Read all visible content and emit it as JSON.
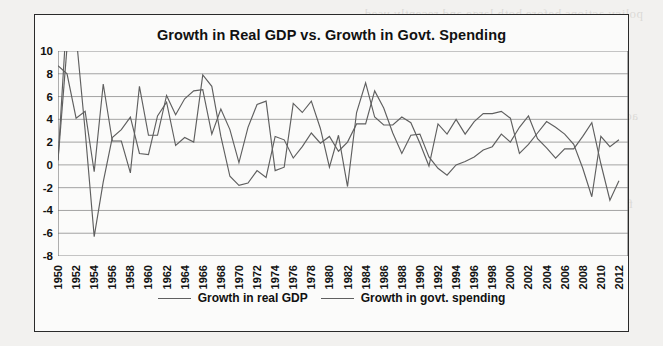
{
  "figure": {
    "title": "Growth in Real GDP vs. Growth in Govt. Spending",
    "frame_color": "#2a2a2a",
    "plot_bg": "#fbfbfa"
  },
  "legend": {
    "position": "bottom-center",
    "items": [
      {
        "label": "Growth in real GDP",
        "color": "#5f5f5f"
      },
      {
        "label": "Growth in govt. spending",
        "color": "#5f5f5f"
      }
    ]
  },
  "axes": {
    "y_ticks": [
      "10",
      "8",
      "6",
      "4",
      "2",
      "0",
      "-2",
      "-4",
      "-6",
      "-8"
    ],
    "x_ticks": [
      "1950",
      "1952",
      "1954",
      "1956",
      "1958",
      "1960",
      "1962",
      "1964",
      "1966",
      "1968",
      "1970",
      "1972",
      "1974",
      "1976",
      "1978",
      "1980",
      "1982",
      "1984",
      "1986",
      "1988",
      "1990",
      "1992",
      "1994",
      "1996",
      "1998",
      "2000",
      "2002",
      "2004",
      "2006",
      "2008",
      "2010",
      "2012"
    ]
  },
  "bleed_text": [
    "policy actions before both large and recently used",
    "the effects of fiscal policy action must be copied at the high level of the right amount and",
    "the right direction",
    "pies fiscal policy in the same way as a monetary policy action is the",
    "box",
    "actions",
    "terms",
    "nan of",
    "economy definitely is necessary and precisely good and they and are acting for mobile",
    "definitely it now have been supported for the fiscal policy action is the tools",
    "fiscal policy",
    "fiscal",
    "these",
    "Auto-matic stabilizers are legal instruments which work in response to the state that affect the level of",
    "Policy fiscal policy: They do things such as redistribute taxes and unemployment insurance",
    "in the are not the fiscal policy tools of a given economy"
  ],
  "chart_data": {
    "type": "line",
    "title": "Growth in Real GDP vs. Growth in Govt. Spending",
    "xlabel": "",
    "ylabel": "",
    "xlim": [
      1950,
      2013
    ],
    "ylim": [
      -8,
      10
    ],
    "grid": true,
    "legend_position": "bottom-center",
    "x": [
      1950,
      1951,
      1952,
      1953,
      1954,
      1955,
      1956,
      1957,
      1958,
      1959,
      1960,
      1961,
      1962,
      1963,
      1964,
      1965,
      1966,
      1967,
      1968,
      1969,
      1970,
      1971,
      1972,
      1973,
      1974,
      1975,
      1976,
      1977,
      1978,
      1979,
      1980,
      1981,
      1982,
      1983,
      1984,
      1985,
      1986,
      1987,
      1988,
      1989,
      1990,
      1991,
      1992,
      1993,
      1994,
      1995,
      1996,
      1997,
      1998,
      1999,
      2000,
      2001,
      2002,
      2003,
      2004,
      2005,
      2006,
      2007,
      2008,
      2009,
      2010,
      2011,
      2012
    ],
    "series": [
      {
        "name": "Growth in real GDP",
        "color": "#5f5f5f",
        "values": [
          8.7,
          8.0,
          4.1,
          4.7,
          -0.6,
          7.1,
          2.1,
          2.1,
          -0.7,
          6.9,
          2.6,
          2.6,
          6.1,
          4.4,
          5.8,
          6.5,
          6.6,
          2.7,
          4.9,
          3.1,
          0.2,
          3.3,
          5.3,
          5.6,
          -0.5,
          -0.2,
          5.4,
          4.6,
          5.6,
          3.2,
          -0.2,
          2.6,
          -1.9,
          4.6,
          7.2,
          4.2,
          3.5,
          3.5,
          4.2,
          3.7,
          1.9,
          -0.1,
          3.6,
          2.7,
          4.0,
          2.7,
          3.8,
          4.5,
          4.5,
          4.7,
          4.1,
          1.0,
          1.8,
          2.8,
          3.8,
          3.3,
          2.7,
          1.8,
          -0.3,
          -2.8,
          2.5,
          1.6,
          2.2
        ]
      },
      {
        "name": "Growth in govt. spending",
        "color": "#5f5f5f",
        "values": [
          0.4,
          13.5,
          11.4,
          3.0,
          -6.3,
          -1.5,
          2.4,
          3.1,
          4.2,
          1.0,
          0.9,
          4.3,
          5.5,
          1.7,
          2.4,
          2.0,
          7.9,
          6.9,
          2.5,
          -1.0,
          -1.8,
          -1.6,
          -0.5,
          -1.1,
          2.5,
          2.2,
          0.6,
          1.6,
          2.8,
          1.9,
          2.5,
          1.2,
          2.0,
          3.6,
          3.6,
          6.5,
          5.0,
          2.8,
          1.0,
          2.6,
          2.7,
          0.7,
          -0.3,
          -0.9,
          0.0,
          0.3,
          0.7,
          1.3,
          1.6,
          2.7,
          2.0,
          3.3,
          4.3,
          2.3,
          1.5,
          0.6,
          1.4,
          1.4,
          2.5,
          3.7,
          0.1,
          -3.1,
          -1.4
        ]
      }
    ]
  }
}
